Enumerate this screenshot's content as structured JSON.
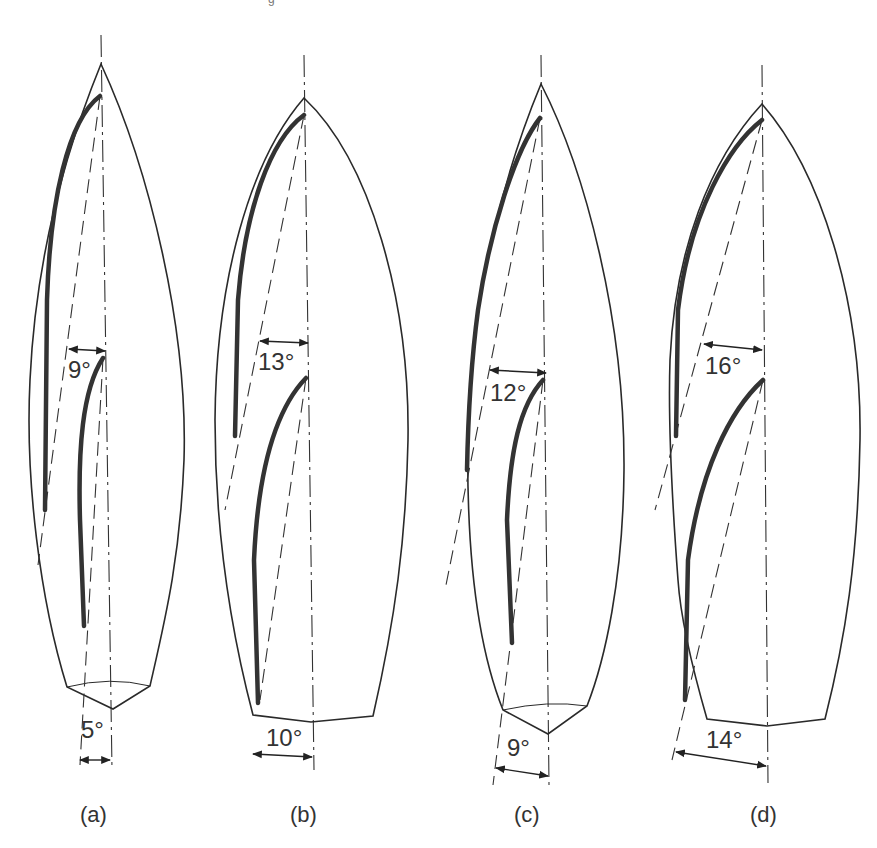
{
  "figure": {
    "top_fragment": "g",
    "panels": [
      {
        "id": "a",
        "caption": "(a)",
        "sail_angle": "9°",
        "keel_angle": "5°"
      },
      {
        "id": "b",
        "caption": "(b)",
        "sail_angle": "13°",
        "keel_angle": "10°"
      },
      {
        "id": "c",
        "caption": "(c)",
        "sail_angle": "12°",
        "keel_angle": "9°"
      },
      {
        "id": "d",
        "caption": "(d)",
        "sail_angle": "16°",
        "keel_angle": "14°"
      }
    ],
    "colors": {
      "line": "#2a2a2a",
      "background": "#ffffff"
    }
  }
}
